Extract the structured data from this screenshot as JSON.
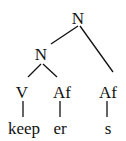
{
  "tree": {
    "root": {
      "label": "N"
    },
    "inner": {
      "label": "N"
    },
    "verb": {
      "label": "V"
    },
    "affix1": {
      "label": "Af"
    },
    "affix2": {
      "label": "Af"
    },
    "words": {
      "keep": "keep",
      "er": "er",
      "s": "s"
    }
  }
}
